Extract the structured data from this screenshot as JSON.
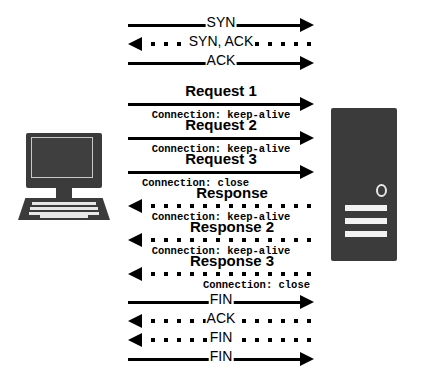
{
  "diagram": {
    "client": {
      "icon": "desktop-computer-icon",
      "color": "#3b3b3b"
    },
    "server": {
      "icon": "server-tower-icon",
      "color": "#3b3b3b",
      "accent": "#f2f2f2"
    },
    "colors": {
      "line": "#000000",
      "background": "#ffffff",
      "device": "#3b3b3b"
    },
    "messages": [
      {
        "id": "syn",
        "label": "SYN",
        "direction": "right",
        "style": "solid",
        "label_position": "inline",
        "sublabel": ""
      },
      {
        "id": "syn-ack",
        "label": "SYN, ACK",
        "direction": "left",
        "style": "dotted",
        "label_position": "inline",
        "sublabel": ""
      },
      {
        "id": "ack",
        "label": "ACK",
        "direction": "right",
        "style": "solid",
        "label_position": "inline",
        "sublabel": ""
      },
      {
        "id": "request-1",
        "label": "Request 1",
        "direction": "right",
        "style": "solid",
        "label_position": "above",
        "sublabel": "Connection: keep-alive",
        "sublabel_align": "center"
      },
      {
        "id": "request-2",
        "label": "Request 2",
        "direction": "right",
        "style": "solid",
        "label_position": "above",
        "sublabel": "Connection: keep-alive",
        "sublabel_align": "center"
      },
      {
        "id": "request-3",
        "label": "Request 3",
        "direction": "right",
        "style": "solid",
        "label_position": "above",
        "sublabel": "Connection: close",
        "sublabel_align": "left"
      },
      {
        "id": "response-1",
        "label": "Response",
        "direction": "left",
        "style": "dotted",
        "label_position": "above",
        "sublabel": "Connection: keep-alive",
        "sublabel_align": "center"
      },
      {
        "id": "response-2",
        "label": "Response 2",
        "direction": "left",
        "style": "dotted",
        "label_position": "above",
        "sublabel": "Connection: keep-alive",
        "sublabel_align": "center"
      },
      {
        "id": "response-3",
        "label": "Response 3",
        "direction": "left",
        "style": "dotted",
        "label_position": "above",
        "sublabel": "Connection: close",
        "sublabel_align": "right"
      },
      {
        "id": "fin-1",
        "label": "FIN",
        "direction": "right",
        "style": "solid",
        "label_position": "inline",
        "sublabel": ""
      },
      {
        "id": "ack-2",
        "label": "ACK",
        "direction": "left",
        "style": "dotted",
        "label_position": "inline",
        "sublabel": ""
      },
      {
        "id": "fin-2",
        "label": "FIN",
        "direction": "left",
        "style": "dotted",
        "label_position": "inline",
        "sublabel": ""
      },
      {
        "id": "fin-3",
        "label": "FIN",
        "direction": "right",
        "style": "solid",
        "label_position": "inline",
        "sublabel": ""
      }
    ]
  }
}
